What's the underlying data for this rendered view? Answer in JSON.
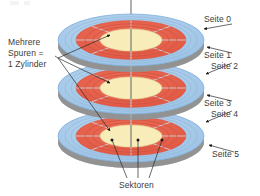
{
  "diagram": {
    "background_color": "#ffffff",
    "platter_count": 3,
    "colors": {
      "platter_outer": "#a9cbe9",
      "platter_outer_edge": "#7fb0dc",
      "track_band": "#e8604c",
      "track_band_dark": "#d9503d",
      "hub": "#f8edb8",
      "hub_edge": "#e8dca0",
      "platter_side": "#9a9a9a",
      "platter_side_shadow": "#7d7d7d",
      "sector_line": "#cfd6dc",
      "leader_line": "#3b3b3b",
      "text": "#3b3b3b",
      "spindle": "#6f6f6f"
    },
    "labels": {
      "cylinder": {
        "line1": "Mehrere",
        "line2": "Spuren =",
        "line3": "1 Zylinder"
      },
      "side0": "Seite 0",
      "side1": "Seite 1",
      "side2": "Seite 2",
      "side3": "Seite 3",
      "side4": "Seite 4",
      "side5": "Seite 5",
      "sectors": "Sektoren"
    },
    "annotations": [
      {
        "name": "side-0",
        "text": "Seite 0",
        "target": "top platter, upper surface"
      },
      {
        "name": "side-1",
        "text": "Seite 1",
        "target": "top platter, lower surface"
      },
      {
        "name": "side-2",
        "text": "Seite 2",
        "target": "middle platter, upper surface"
      },
      {
        "name": "side-3",
        "text": "Seite 3",
        "target": "middle platter, lower surface"
      },
      {
        "name": "side-4",
        "text": "Seite 4",
        "target": "bottom platter, upper surface"
      },
      {
        "name": "side-5",
        "text": "Seite 5",
        "target": "bottom platter, lower surface"
      },
      {
        "name": "cylinder",
        "text": "Mehrere Spuren = 1 Zylinder",
        "target": "aligned tracks on all three platters"
      },
      {
        "name": "sectors",
        "text": "Sektoren",
        "target": "three sector wedges on bottom platter"
      }
    ],
    "sector_divider_count": 8,
    "tracks_per_platter": 4
  }
}
